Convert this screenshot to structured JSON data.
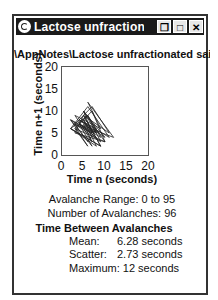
{
  "window": {
    "title": "Lactose unfractionate...",
    "buttons": [
      "restore",
      "maximize",
      "close"
    ]
  },
  "path_label": "\\AppNotes\\Lactose unfractionated sai",
  "chart_data": {
    "type": "line",
    "title": "",
    "xlabel": "Time n (seconds)",
    "ylabel": "Time n+1 (seconds)",
    "xlim": [
      0,
      20
    ],
    "ylim": [
      0,
      20
    ],
    "xticks": [
      "0",
      "5",
      "10",
      "15",
      "20"
    ],
    "yticks": [
      "0",
      "5",
      "10",
      "15",
      "20"
    ],
    "grid": false,
    "x": [
      3,
      6,
      2,
      8,
      4,
      7,
      10,
      3,
      5,
      9,
      2,
      6,
      11,
      4,
      8,
      5,
      7,
      3,
      9,
      6,
      12,
      4,
      7,
      2,
      8,
      5,
      10,
      3,
      6,
      9,
      4,
      7,
      5,
      8,
      2,
      6,
      9,
      3,
      7,
      5,
      10,
      4,
      8,
      6,
      3,
      7,
      11,
      5,
      9,
      2
    ],
    "y": [
      6,
      2,
      8,
      4,
      7,
      10,
      3,
      5,
      9,
      2,
      6,
      11,
      4,
      8,
      5,
      7,
      3,
      9,
      6,
      12,
      4,
      7,
      2,
      8,
      5,
      10,
      3,
      6,
      9,
      4,
      7,
      5,
      8,
      2,
      6,
      9,
      3,
      7,
      5,
      10,
      4,
      8,
      6,
      3,
      7,
      11,
      5,
      9,
      2,
      6
    ]
  },
  "stats": {
    "avalanche_range": "Avalanche Range: 0 to 95",
    "num_avalanches": "Number of Avalanches: 96",
    "section_title": "Time Between Avalanches",
    "mean_label": "Mean:",
    "mean_value": "6.28 seconds",
    "scatter_label": "Scatter:",
    "scatter_value": "2.73 seconds",
    "max_label": "Maximum:",
    "max_value": "12 seconds"
  }
}
